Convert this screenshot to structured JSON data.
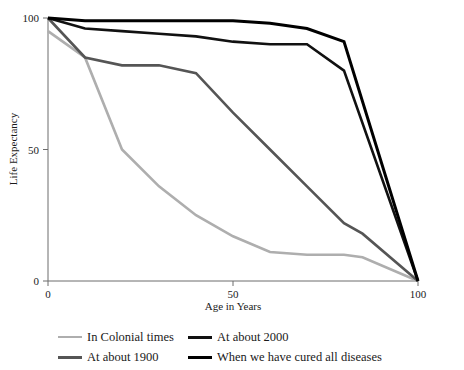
{
  "chart_data": {
    "type": "line",
    "title": "",
    "xlabel": "Age in Years",
    "ylabel": "Life Expectancy",
    "xlim": [
      0,
      100
    ],
    "ylim": [
      0,
      100
    ],
    "xticks": [
      0,
      50,
      100
    ],
    "yticks": [
      0,
      50,
      100
    ],
    "xtick_labels": [
      "0",
      "50",
      "100"
    ],
    "ytick_labels": [
      "0",
      "50",
      "100"
    ],
    "grid": false,
    "legend_position": "below",
    "series": [
      {
        "name": "In Colonial times",
        "color": "#aeaeae",
        "width": 2.6,
        "x": [
          0,
          10,
          20,
          30,
          40,
          50,
          60,
          70,
          80,
          85,
          100
        ],
        "y": [
          95,
          85,
          50,
          36,
          25,
          17,
          11,
          10,
          10,
          9,
          0
        ]
      },
      {
        "name": "At about 1900",
        "color": "#555555",
        "width": 2.6,
        "x": [
          0,
          10,
          20,
          30,
          40,
          50,
          60,
          70,
          80,
          85,
          100
        ],
        "y": [
          100,
          85,
          82,
          82,
          79,
          64,
          50,
          36,
          22,
          18,
          0
        ]
      },
      {
        "name": "At about 2000",
        "color": "#111111",
        "width": 2.6,
        "x": [
          0,
          10,
          20,
          30,
          40,
          50,
          60,
          70,
          80,
          100
        ],
        "y": [
          100,
          96,
          95,
          94,
          93,
          91,
          90,
          90,
          80,
          0
        ]
      },
      {
        "name": "When we have cured all diseases",
        "color": "#000000",
        "width": 3.0,
        "x": [
          0,
          10,
          20,
          30,
          40,
          50,
          60,
          70,
          80,
          100
        ],
        "y": [
          100,
          99,
          99,
          99,
          99,
          99,
          98,
          96,
          91,
          0
        ]
      }
    ]
  },
  "legend": {
    "items": [
      {
        "label": "In Colonial times",
        "color": "#aeaeae",
        "thickness": "2.6px"
      },
      {
        "label": "At about 2000",
        "color": "#111111",
        "thickness": "3.4px"
      },
      {
        "label": "At about 1900",
        "color": "#555555",
        "thickness": "3.0px"
      },
      {
        "label": "When we have cured all diseases",
        "color": "#000000",
        "thickness": "3.6px"
      }
    ]
  }
}
